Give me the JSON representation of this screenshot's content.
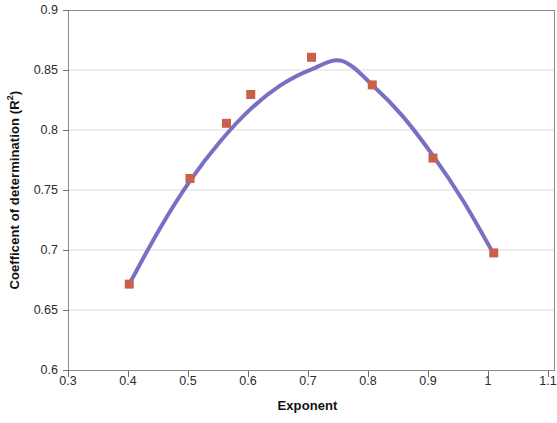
{
  "chart_data": {
    "type": "scatter",
    "title": "",
    "xlabel": "Exponent",
    "ylabel": "Coefficent of determination (R²)",
    "ylabel_main": "Coefficent of determination (R",
    "ylabel_sup": "2",
    "ylabel_close": ")",
    "xlim": [
      0.3,
      1.1
    ],
    "ylim": [
      0.6,
      0.9
    ],
    "xticks": [
      "0.3",
      "0.4",
      "0.5",
      "0.6",
      "0.7",
      "0.8",
      "0.9",
      "1",
      "1.1"
    ],
    "xtick_values": [
      0.3,
      0.4,
      0.5,
      0.6,
      0.7,
      0.8,
      0.9,
      1.0,
      1.1
    ],
    "yticks": [
      "0.6",
      "0.65",
      "0.7",
      "0.75",
      "0.8",
      "0.85",
      "0.9"
    ],
    "ytick_values": [
      0.6,
      0.65,
      0.7,
      0.75,
      0.8,
      0.85,
      0.9
    ],
    "grid": "horizontal",
    "legend": "none",
    "x": [
      0.4,
      0.5,
      0.56,
      0.6,
      0.7,
      0.8,
      0.9,
      1.0
    ],
    "values": [
      0.672,
      0.76,
      0.806,
      0.83,
      0.861,
      0.838,
      0.777,
      0.698
    ],
    "series": [
      {
        "name": "Coefficient of determination",
        "marker": "square",
        "marker_color": "#c8604b",
        "x": [
          0.4,
          0.5,
          0.56,
          0.6,
          0.7,
          0.8,
          0.9,
          1.0
        ],
        "values": [
          0.672,
          0.76,
          0.806,
          0.83,
          0.861,
          0.838,
          0.777,
          0.698
        ]
      },
      {
        "name": "Fitted quadratic trend",
        "type": "line",
        "line_color": "#7b6fc4",
        "x": [
          0.4,
          0.45,
          0.5,
          0.55,
          0.6,
          0.65,
          0.7,
          0.75,
          0.8,
          0.85,
          0.9,
          0.95,
          1.0
        ],
        "values": [
          0.672,
          0.718,
          0.758,
          0.791,
          0.818,
          0.838,
          0.851,
          0.858,
          0.838,
          0.812,
          0.779,
          0.741,
          0.697
        ]
      }
    ],
    "colors": {
      "marker": "#c8604b",
      "line": "#7b6fc4",
      "grid": "#d8d8d8",
      "axis": "#6f6f6f",
      "text": "#1a1a1a",
      "background": "#ffffff"
    }
  }
}
